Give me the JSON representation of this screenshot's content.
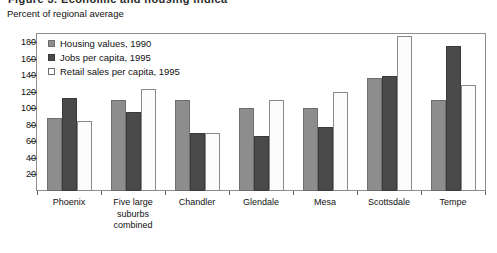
{
  "title_fragment": "Figure 3. Economic and housing indicators",
  "subtitle": "Percent of regional average",
  "chart_data": {
    "type": "bar",
    "title": "Figure 3. Economic and housing indicators",
    "subtitle": "Percent of regional average",
    "xlabel": "",
    "ylabel": "Percent of regional average",
    "ylim": [
      0,
      190
    ],
    "yticks": [
      20,
      40,
      60,
      80,
      100,
      120,
      140,
      160,
      180
    ],
    "grid": false,
    "legend_position": "upper-left-inside",
    "categories": [
      "Phoenix",
      "Five large suburbs combined",
      "Chandler",
      "Glendale",
      "Mesa",
      "Scottsdale",
      "Tempe"
    ],
    "series": [
      {
        "name": "Housing values, 1990",
        "color": "#8d8d8d",
        "values": [
          88,
          110,
          110,
          100,
          100,
          137,
          110
        ]
      },
      {
        "name": "Jobs per capita, 1995",
        "color": "#4a4a4a",
        "values": [
          112,
          96,
          70,
          67,
          78,
          139,
          175
        ]
      },
      {
        "name": "Retail sales per capita, 1995",
        "color": "#ffffff",
        "values": [
          85,
          124,
          70,
          110,
          120,
          188,
          128
        ]
      }
    ]
  }
}
